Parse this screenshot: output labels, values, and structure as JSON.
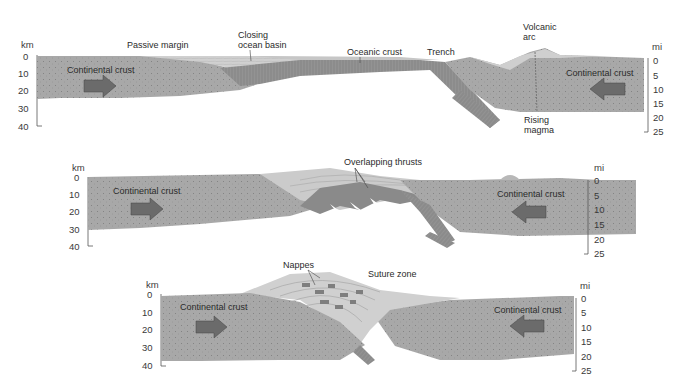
{
  "colors": {
    "continental": "#a9a9a9",
    "continental_dark": "#9a9a9a",
    "oceanic": "#8e8e8e",
    "sediment": "#d2d2d2",
    "ocean_water": "#c4c4c4",
    "arrow": "#6b6b6b",
    "axis": "#555555"
  },
  "units": {
    "left": "km",
    "right": "mi"
  },
  "km_ticks": [
    "0",
    "10",
    "20",
    "30",
    "40"
  ],
  "mi_ticks": [
    "0",
    "5",
    "10",
    "15",
    "20",
    "25"
  ],
  "panel1": {
    "labels": {
      "passive_margin": "Passive margin",
      "closing_ocean_basin_1": "Closing",
      "closing_ocean_basin_2": "ocean basin",
      "oceanic_crust": "Oceanic crust",
      "trench": "Trench",
      "volcanic_arc_1": "Volcanic",
      "volcanic_arc_2": "arc",
      "rising_magma_1": "Rising",
      "rising_magma_2": "magma",
      "continental_left": "Continental crust",
      "continental_right": "Continental crust"
    }
  },
  "panel2": {
    "labels": {
      "overlapping_thrusts": "Overlapping thrusts",
      "continental_left": "Continental crust",
      "continental_right": "Continental crust"
    }
  },
  "panel3": {
    "labels": {
      "nappes": "Nappes",
      "suture_zone": "Suture zone",
      "continental_left": "Continental crust",
      "continental_right": "Continental crust"
    }
  }
}
